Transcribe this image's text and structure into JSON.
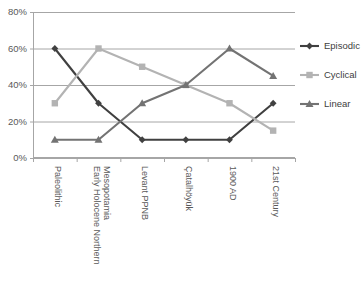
{
  "chart_data": {
    "type": "line",
    "title": "",
    "subtitle": "",
    "xlabel": "",
    "ylabel": "",
    "categories": [
      "Paleolithic",
      "Early Holocene Northern Mesopotamia",
      "Levant PPNB",
      "Çatalhöyük",
      "1900 AD",
      "21st Century"
    ],
    "category_lines": [
      [
        "Paleolithic"
      ],
      [
        "Early Holocene Northern",
        "Mesopotamia"
      ],
      [
        "Levant PPNB"
      ],
      [
        "Çatalhöyük"
      ],
      [
        "1900 AD"
      ],
      [
        "21st Century"
      ]
    ],
    "series": [
      {
        "name": "Episodic",
        "color": "#404040",
        "marker": "diamond",
        "values": [
          60,
          30,
          10,
          10,
          10,
          30
        ]
      },
      {
        "name": "Cyclical",
        "color": "#b3b3b3",
        "marker": "square",
        "values": [
          30,
          60,
          50,
          40,
          30,
          15
        ]
      },
      {
        "name": "Linear",
        "color": "#737373",
        "marker": "triangle",
        "values": [
          10,
          10,
          30,
          40,
          60,
          45
        ]
      }
    ],
    "ylim": [
      0,
      80
    ],
    "yticks": [
      0,
      20,
      40,
      60,
      80
    ],
    "ytick_labels": [
      "0%",
      "20%",
      "40%",
      "60%",
      "80%"
    ],
    "grid": true,
    "grid_axis": "y",
    "legend_position": "right",
    "legend_entries": [
      "Episodic",
      "Cyclical",
      "Linear"
    ]
  },
  "axes": {
    "y_axis_name": "percentage-axis",
    "x_axis_name": "period-axis"
  }
}
